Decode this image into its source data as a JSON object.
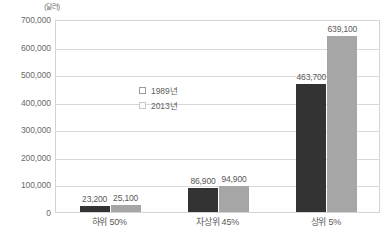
{
  "chart_data": {
    "type": "bar",
    "title": "",
    "subtitle": "",
    "unit_label": "(달러)",
    "xlabel": "",
    "ylabel": "",
    "ylim": [
      0,
      700000
    ],
    "ytick_step": 100000,
    "grid": true,
    "legend_position": "inside-upper-left",
    "categories": [
      "하위 50%",
      "차상위 45%",
      "상위 5%"
    ],
    "series": [
      {
        "name": "1989년",
        "color": "#333333",
        "values": [
          23200,
          86900,
          463700
        ],
        "value_labels": [
          "23,200",
          "86,900",
          "463,700"
        ]
      },
      {
        "name": "2013년",
        "color": "#a6a6a6",
        "values": [
          25100,
          94900,
          639100
        ],
        "value_labels": [
          "25,100",
          "94,900",
          "639,100"
        ]
      }
    ],
    "ytick_labels": [
      "700,000",
      "600,000",
      "500,000",
      "400,000",
      "300,000",
      "200,000",
      "100,000",
      "0"
    ],
    "ytick_values": [
      700000,
      600000,
      500000,
      400000,
      300000,
      200000,
      100000,
      0
    ]
  },
  "colors": {
    "series_1989": "#333333",
    "series_2013": "#a6a6a6",
    "gridline": "#d9d9d9",
    "plot_border": "#d4d4d4",
    "text": "#5a5a5a"
  }
}
